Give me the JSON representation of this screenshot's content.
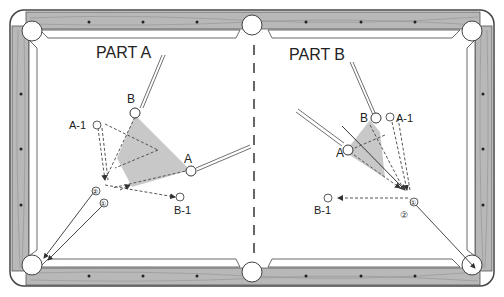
{
  "diagram": {
    "type": "billiards-table-shot-diagram",
    "colors": {
      "rail_wood": "#b8b8b8",
      "cushion": "#ffffff",
      "shaded_zone": "#c8c8c8",
      "line": "#333333"
    },
    "parts": [
      {
        "title": "PART A",
        "balls": [
          {
            "label": "B"
          },
          {
            "label": "A"
          }
        ],
        "targets": [
          {
            "label": "A-1"
          },
          {
            "label": "B-1"
          }
        ],
        "contact_points": [
          {
            "label": "①"
          },
          {
            "label": "②"
          }
        ]
      },
      {
        "title": "PART B",
        "balls": [
          {
            "label": "B"
          },
          {
            "label": "A"
          }
        ],
        "targets": [
          {
            "label": "A-1"
          },
          {
            "label": "B-1"
          }
        ],
        "contact_points": [
          {
            "label": "①"
          },
          {
            "label": "②"
          }
        ]
      }
    ]
  }
}
